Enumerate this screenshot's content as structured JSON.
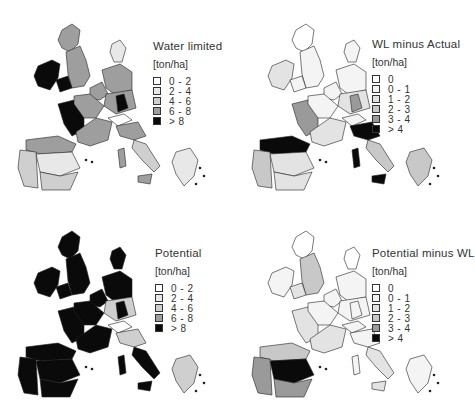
{
  "figure": {
    "panels": [
      {
        "id": "water-limited",
        "title": "Water limited",
        "unit": "[ton/ha]",
        "legend": [
          {
            "label": "0 - 2",
            "color": "#ffffff"
          },
          {
            "label": "2 - 4",
            "color": "#e8e8e8"
          },
          {
            "label": "4 - 6",
            "color": "#cfcfcf"
          },
          {
            "label": "6 - 8",
            "color": "#9e9e9e"
          },
          {
            "label": "> 8",
            "color": "#0a0a0a"
          }
        ]
      },
      {
        "id": "wl-minus-actual",
        "title": "WL minus Actual",
        "unit": "[ton/ha]",
        "legend": [
          {
            "label": "0",
            "color": "#ffffff"
          },
          {
            "label": "0 - 1",
            "color": "#f4f4f4"
          },
          {
            "label": "1 - 2",
            "color": "#e3e3e3"
          },
          {
            "label": "2 - 3",
            "color": "#c8c8c8"
          },
          {
            "label": "3 - 4",
            "color": "#9a9a9a"
          },
          {
            "label": "> 4",
            "color": "#0a0a0a"
          }
        ]
      },
      {
        "id": "potential",
        "title": "Potential",
        "unit": "[ton/ha]",
        "legend": [
          {
            "label": "0 - 2",
            "color": "#ffffff"
          },
          {
            "label": "2 - 4",
            "color": "#e8e8e8"
          },
          {
            "label": "4 - 6",
            "color": "#cfcfcf"
          },
          {
            "label": "6 - 8",
            "color": "#9e9e9e"
          },
          {
            "label": "> 8",
            "color": "#0a0a0a"
          }
        ]
      },
      {
        "id": "potential-minus-wl",
        "title": "Potential minus WL",
        "unit": "[ton/ha]",
        "legend": [
          {
            "label": "0",
            "color": "#ffffff"
          },
          {
            "label": "0 - 1",
            "color": "#f4f4f4"
          },
          {
            "label": "1 - 2",
            "color": "#e3e3e3"
          },
          {
            "label": "2 - 3",
            "color": "#c8c8c8"
          },
          {
            "label": "3 - 4",
            "color": "#9a9a9a"
          },
          {
            "label": "> 4",
            "color": "#0a0a0a"
          }
        ]
      }
    ]
  },
  "region_fills": {
    "water-limited": {
      "ireland": 4,
      "scotland": 3,
      "england": 3,
      "wales": 4,
      "denmark": 1,
      "benelux": 3,
      "germany_n": 3,
      "germany_s": 3,
      "germany_se": 4,
      "france_w": 4,
      "france_n": 3,
      "france_s": 3,
      "alps": 0,
      "italy_n": 3,
      "italy_s": 2,
      "sardinia": 3,
      "sicily": 3,
      "spain_n": 3,
      "spain_c": 1,
      "spain_s": 2,
      "portugal": 2,
      "greece": 1
    },
    "wl-minus-actual": {
      "ireland": 2,
      "scotland": 0,
      "england": 1,
      "wales": 1,
      "denmark": 1,
      "benelux": 1,
      "germany_n": 1,
      "germany_s": 2,
      "germany_se": 4,
      "france_w": 4,
      "france_n": 1,
      "france_s": 2,
      "alps": 1,
      "italy_n": 5,
      "italy_s": 3,
      "sardinia": 5,
      "sicily": 5,
      "spain_n": 5,
      "spain_c": 2,
      "spain_s": 2,
      "portugal": 3,
      "greece": 3
    },
    "potential": {
      "ireland": 4,
      "scotland": 4,
      "england": 4,
      "wales": 4,
      "denmark": 4,
      "benelux": 4,
      "germany_n": 4,
      "germany_s": 2,
      "germany_se": 4,
      "france_w": 4,
      "france_n": 4,
      "france_s": 4,
      "alps": 0,
      "italy_n": 2,
      "italy_s": 4,
      "sardinia": 4,
      "sicily": 4,
      "spain_n": 4,
      "spain_c": 4,
      "spain_s": 4,
      "portugal": 4,
      "greece": 2
    },
    "potential-minus-wl": {
      "ireland": 1,
      "scotland": 0,
      "england": 3,
      "wales": 2,
      "denmark": 0,
      "benelux": 1,
      "germany_n": 1,
      "germany_s": 1,
      "germany_se": 1,
      "france_w": 2,
      "france_n": 1,
      "france_s": 2,
      "alps": 1,
      "italy_n": 1,
      "italy_s": 2,
      "sardinia": 1,
      "sicily": 2,
      "spain_n": 3,
      "spain_c": 5,
      "spain_s": 4,
      "portugal": 4,
      "greece": 1
    }
  }
}
